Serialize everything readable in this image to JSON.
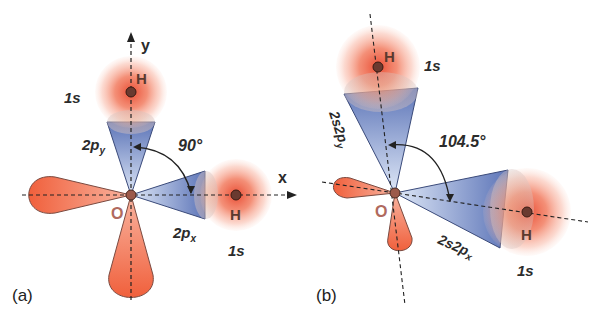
{
  "figure": {
    "panels": [
      {
        "id": "a",
        "label": "(a)",
        "axes": {
          "x": "x",
          "y": "y"
        },
        "angle": "90°",
        "atoms": {
          "center": "O",
          "h_top": "H",
          "h_right": "H"
        },
        "orbitals": {
          "top_h": "1s",
          "right_h": "1s",
          "top_p_main": "2p",
          "top_p_sub": "y",
          "right_p_main": "2p",
          "right_p_sub": "x"
        }
      },
      {
        "id": "b",
        "label": "(b)",
        "angle": "104.5°",
        "atoms": {
          "center": "O",
          "h_top": "H",
          "h_right": "H"
        },
        "orbitals": {
          "top_h": "1s",
          "right_h": "1s",
          "top_hybrid_main": "2s2p",
          "top_hybrid_sub": "y",
          "right_hybrid_main": "2s2p",
          "right_hybrid_sub": "x"
        }
      }
    ],
    "colors": {
      "s_orbital": "#f0603a",
      "p_lobe_red": "#f26a46",
      "p_lobe_blue": "#6f86c4",
      "atom": "#8a4a3c",
      "axis": "#222222"
    }
  }
}
